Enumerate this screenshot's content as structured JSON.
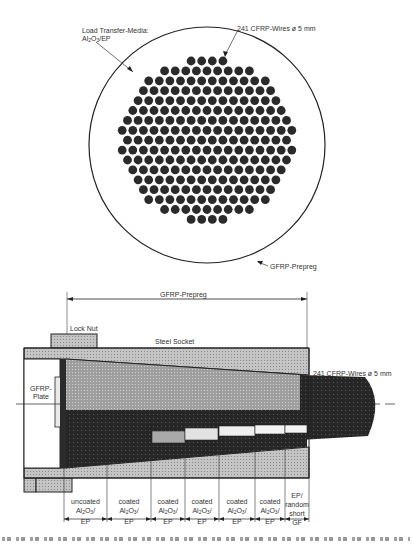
{
  "cross_section": {
    "label_media_line1": "Load Transfer-Media:",
    "label_media_line2": "Al2O3/EP",
    "label_wires": "241 CFRP-Wires ø 5 mm",
    "label_prepreg": "GFRP-Prepreg",
    "wire_count": "241"
  },
  "longitudinal": {
    "label_prepreg_dim": "GFRP-Prepreg",
    "label_lock_nut": "Lock Nut",
    "label_socket": "Steel Socket",
    "label_wires": "241 CFRP-Wires ø 5 mm",
    "label_plate_line1": "GFRP-",
    "label_plate_line2": "Plate"
  },
  "segments": [
    {
      "l1": "uncoated",
      "l2": "Al2O3/",
      "l3": "EP"
    },
    {
      "l1": "coated",
      "l2": "Al2O3/",
      "l3": "EP"
    },
    {
      "l1": "coated",
      "l2": "Al2O3/",
      "l3": "EP"
    },
    {
      "l1": "coated",
      "l2": "Al2O3/",
      "l3": "EP"
    },
    {
      "l1": "coated",
      "l2": "Al2O3/",
      "l3": "EP"
    },
    {
      "l1": "coated",
      "l2": "Al2O3/",
      "l3": "EP"
    },
    {
      "l1": "EP/",
      "l2": "random",
      "l3": "short",
      "l4": "GF"
    }
  ],
  "colors": {
    "ink": "#1a1a1a",
    "fill_gray": "#bdbdbd",
    "dark": "#2b2b2b",
    "light": "#e6e6e6"
  }
}
